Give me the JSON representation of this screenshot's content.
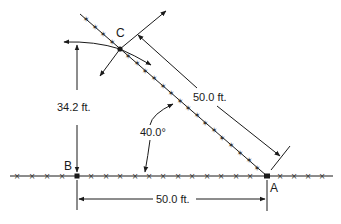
{
  "diagram": {
    "title": "",
    "points": {
      "a": {
        "label": "A",
        "x": 267,
        "y": 176
      },
      "b": {
        "label": "B",
        "x": 77,
        "y": 176
      },
      "c": {
        "label": "C",
        "x": 120,
        "y": 49
      }
    },
    "dimensions": {
      "cb_offset": "34.2 ft.",
      "ca_distance": "50.0 ft.",
      "ba_distance": "50.0 ft.",
      "angle_bac": "40.0°"
    },
    "line_marks": {
      "baseline_mark": "×",
      "diagonal_mark": "✶"
    },
    "colors": {
      "ink": "#1a1a1a",
      "background": "#ffffff"
    }
  }
}
